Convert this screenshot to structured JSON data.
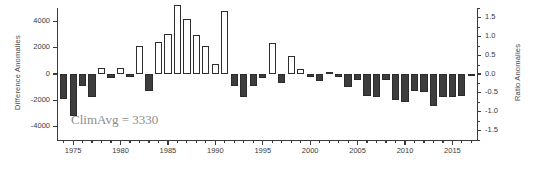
{
  "chart_data": {
    "type": "bar",
    "title": "",
    "xlabel": "",
    "ylabel": "Difference Anomalies",
    "y2label": "Ratio Anomalies",
    "ylim": [
      -5000,
      5000
    ],
    "y2lim": [
      -1.75,
      1.75
    ],
    "xlim": [
      1973.3,
      2017.7
    ],
    "grid": false,
    "legend": null,
    "annotations": [
      {
        "text": "ClimAvg = 3330",
        "x": 1976.0,
        "y": -4100
      }
    ],
    "yticks": [
      4000,
      2000,
      0,
      -2000,
      -4000
    ],
    "ytick_labels": [
      "4000",
      "2000",
      "0",
      "-2000",
      "-4000"
    ],
    "y2ticks": [
      1.5,
      1.0,
      0.5,
      0.0,
      -0.5,
      -1.0,
      -1.5
    ],
    "y2tick_labels": [
      "1.5",
      "1.0",
      "0.5",
      "0.0",
      "-0.5",
      "-1.0",
      "-1.5"
    ],
    "xticks": [
      1975,
      1980,
      1985,
      1990,
      1995,
      2000,
      2005,
      2010,
      2015
    ],
    "xtick_labels": [
      "1975",
      "1980",
      "1985",
      "1990",
      "1995",
      "2000",
      "2005",
      "2010",
      "2015"
    ],
    "xminor_start": 1974,
    "xminor_end": 2017,
    "colors": {
      "negative_fill": "#3d3d3d",
      "positive_fill": "#ffffff",
      "bar_edge": "#2e2e2e",
      "axis": "#3a3a3a",
      "annotation": "#8d8d8d"
    },
    "categories": [
      1974,
      1975,
      1976,
      1977,
      1978,
      1979,
      1980,
      1981,
      1982,
      1983,
      1984,
      1985,
      1986,
      1987,
      1988,
      1989,
      1990,
      1991,
      1992,
      1993,
      1994,
      1995,
      1996,
      1997,
      1998,
      1999,
      2000,
      2001,
      2002,
      2003,
      2004,
      2005,
      2006,
      2007,
      2008,
      2009,
      2010,
      2011,
      2012,
      2013,
      2014,
      2015,
      2016,
      2017
    ],
    "values": [
      -1900,
      -3150,
      -900,
      -1750,
      420,
      -290,
      430,
      -260,
      2150,
      -1300,
      2420,
      3020,
      5250,
      4200,
      2960,
      2130,
      760,
      4800,
      -900,
      -1750,
      -900,
      -300,
      2350,
      -650,
      1400,
      380,
      -220,
      -520,
      140,
      -220,
      -950,
      -480,
      -1700,
      -1780,
      -480,
      -2000,
      -2150,
      -1280,
      -1400,
      -2450,
      -1750,
      -1780,
      -1700,
      -120
    ]
  }
}
